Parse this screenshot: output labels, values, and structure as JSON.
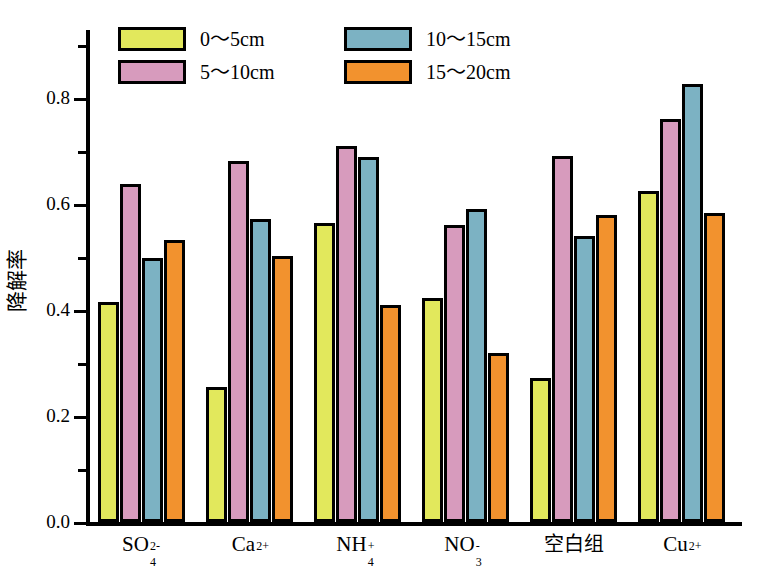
{
  "chart_data": {
    "type": "bar",
    "title": "",
    "xlabel": "",
    "ylabel": "降解率",
    "ylim": [
      0.0,
      0.9
    ],
    "yticks": [
      0.0,
      0.2,
      0.4,
      0.6,
      0.8
    ],
    "ytick_labels": [
      "0.0",
      "0.2",
      "0.4",
      "0.6",
      "0.8"
    ],
    "minor_yticks": [
      0.1,
      0.3,
      0.5,
      0.7,
      0.9
    ],
    "grid": false,
    "legend_position": "top-center",
    "categories": [
      "SO4^2-",
      "Ca^2+",
      "NH4^+",
      "NO3^-",
      "空白组",
      "Cu^2+"
    ],
    "category_labels_html": [
      {
        "base": "SO",
        "sub": "4",
        "sup": "2-",
        "cjk": false
      },
      {
        "base": "Ca",
        "sub": "",
        "sup": "2+",
        "cjk": false
      },
      {
        "base": "NH",
        "sub": "4",
        "sup": "+",
        "cjk": false
      },
      {
        "base": "NO",
        "sub": "3",
        "sup": "-",
        "cjk": false
      },
      {
        "base": "空白组",
        "sub": "",
        "sup": "",
        "cjk": true
      },
      {
        "base": "Cu",
        "sub": "",
        "sup": "2+",
        "cjk": false
      }
    ],
    "series": [
      {
        "name": "0～5cm",
        "color": "#e2e85c",
        "values": [
          0.415,
          0.255,
          0.565,
          0.423,
          0.272,
          0.625
        ]
      },
      {
        "name": "5～10cm",
        "color": "#d79bbd",
        "values": [
          0.637,
          0.681,
          0.71,
          0.56,
          0.691,
          0.761
        ]
      },
      {
        "name": "10～15cm",
        "color": "#7cb2c3",
        "values": [
          0.498,
          0.572,
          0.689,
          0.59,
          0.54,
          0.827
        ]
      },
      {
        "name": "15～20cm",
        "color": "#f2922e",
        "values": [
          0.533,
          0.502,
          0.41,
          0.318,
          0.58,
          0.583
        ]
      }
    ]
  },
  "legend": {
    "columns": [
      {
        "entries": [
          {
            "label": "0～5cm",
            "color": "#e2e85c",
            "swatch_name": "legend-swatch-0-5cm"
          },
          {
            "label": "5～10cm",
            "color": "#d79bbd",
            "swatch_name": "legend-swatch-5-10cm"
          }
        ]
      },
      {
        "entries": [
          {
            "label": "10～15cm",
            "color": "#7cb2c3",
            "swatch_name": "legend-swatch-10-15cm"
          },
          {
            "label": "15～20cm",
            "color": "#f2922e",
            "swatch_name": "legend-swatch-15-20cm"
          }
        ]
      }
    ]
  },
  "axis": {
    "y_title": "降解率",
    "y_labels": [
      "0.8",
      "0.6",
      "0.4",
      "0.2",
      "0.0"
    ]
  },
  "colors": {
    "series_0_5cm": "#e2e85c",
    "series_5_10cm": "#d79bbd",
    "series_10_15cm": "#7cb2c3",
    "series_15_20cm": "#f2922e",
    "outline": "#000000",
    "background": "#ffffff"
  }
}
